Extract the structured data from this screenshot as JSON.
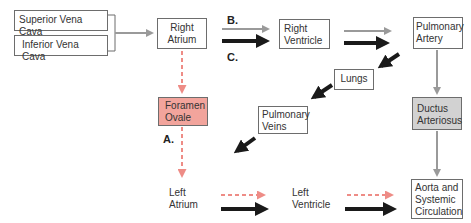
{
  "nodes": {
    "superior_vena_cava": "Superior Vena Cava",
    "inferior_vena_cava": "Inferior Vena Cava",
    "right_atrium": [
      "Right",
      "Atrium"
    ],
    "right_ventricle": [
      "Right",
      "Ventricle"
    ],
    "pulmonary_artery": [
      "Pulmonary",
      "Artery"
    ],
    "lungs": "Lungs",
    "pulmonary_veins": [
      "Pulmonary",
      "Veins"
    ],
    "foramen_ovale": [
      "Foramen",
      "Ovale"
    ],
    "ductus_arteriosus": [
      "Ductus",
      "Arteriosus"
    ],
    "left_atrium": [
      "Left",
      "Atrium"
    ],
    "left_ventricle": [
      "Left",
      "Ventricle"
    ],
    "aorta": [
      "Aorta and",
      "Systemic",
      "Circulation"
    ]
  },
  "labels": {
    "a": "A.",
    "b": "B.",
    "c": "C."
  },
  "colors": {
    "foramen_fill": "#f2a49c",
    "ductus_fill": "#d2d2d2",
    "grey_arrow": "#9a9a9a",
    "black_arrow": "#1a1a1a",
    "dashed_arrow": "#ee8c86"
  }
}
